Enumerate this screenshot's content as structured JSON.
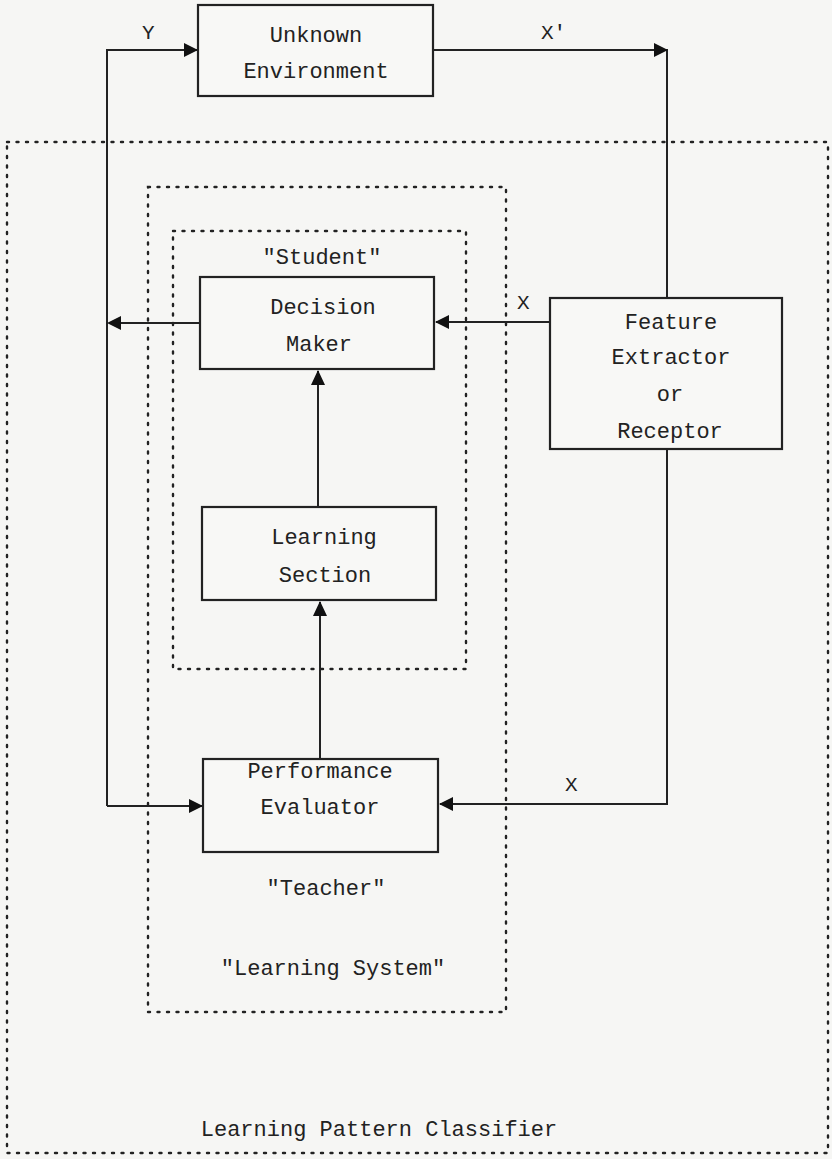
{
  "diagram": {
    "title": "Learning Pattern Classifier",
    "blocks": {
      "environment": {
        "line1": "Unknown",
        "line2": "Environment"
      },
      "decision_maker": {
        "line1": "Decision",
        "line2": "Maker"
      },
      "feature_extractor": {
        "line1": "Feature",
        "line2": "Extractor",
        "line3": "or",
        "line4": "Receptor"
      },
      "learning_section": {
        "line1": "Learning",
        "line2": "Section"
      },
      "performance_evaluator": {
        "line1": "Performance",
        "line2": "Evaluator"
      }
    },
    "groups": {
      "student": "\"Student\"",
      "teacher": "\"Teacher\"",
      "learning_system": "\"Learning System\"",
      "classifier": "Learning Pattern Classifier"
    },
    "signals": {
      "y_to_environment": "Y",
      "x_prime_from_environment": "X'",
      "x_to_decision_maker": "X",
      "x_to_evaluator": "X"
    },
    "edges": [
      {
        "from": "environment",
        "to": "feature_extractor",
        "label": "X'"
      },
      {
        "from": "feature_extractor",
        "to": "decision_maker",
        "label": "X"
      },
      {
        "from": "feature_extractor",
        "to": "performance_evaluator",
        "label": "X"
      },
      {
        "from": "decision_maker",
        "to": "environment",
        "label": "Y"
      },
      {
        "from": "decision_maker",
        "to": "performance_evaluator",
        "label": "Y"
      },
      {
        "from": "learning_section",
        "to": "decision_maker",
        "label": ""
      },
      {
        "from": "performance_evaluator",
        "to": "learning_section",
        "label": ""
      }
    ]
  }
}
